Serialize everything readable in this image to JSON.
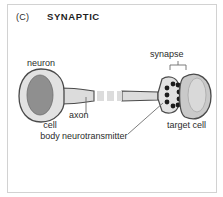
{
  "figure": {
    "panel_letter": "(C)",
    "title": "SYNAPTIC",
    "type": "biological-diagram"
  },
  "labels": {
    "neuron": "neuron",
    "cell_body": "cell\nbody",
    "cell_body_line1": "cell",
    "cell_body_line2": "body",
    "axon": "axon",
    "neurotransmitter": "neurotransmitter",
    "synapse": "synapse",
    "target_cell": "target cell"
  },
  "colors": {
    "background": "#ffffff",
    "frame_border": "#d2d2d2",
    "outline": "#4a4a4a",
    "cell_fill": "#e2e2e2",
    "nucleus_fill": "#8f8f8f",
    "target_fill": "#c9c9c9",
    "target_nucleus_fill": "#d9d9d9",
    "axon_fill": "#dcdcdc",
    "vesicle_fill": "#1c1c1c",
    "text": "#2b2b2b",
    "leader_line": "#6e6e6e"
  },
  "structures": [
    {
      "name": "neuron-cell-body",
      "shape": "rounded-teardrop",
      "has_nucleus": true
    },
    {
      "name": "axon",
      "shape": "tapering-tube",
      "interrupted": true,
      "break_style": "dashed"
    },
    {
      "name": "axon-terminal",
      "shape": "flared-bouton",
      "vesicle_count": 9
    },
    {
      "name": "synaptic-cleft",
      "shape": "narrow-gap"
    },
    {
      "name": "target-cell",
      "shape": "oval",
      "has_nucleus": true
    }
  ],
  "vesicles": {
    "count": 9,
    "inner_cluster": [
      {
        "cx": 159,
        "cy": 83
      },
      {
        "cx": 159,
        "cy": 90
      },
      {
        "cx": 159,
        "cy": 97
      },
      {
        "cx": 165,
        "cy": 79
      },
      {
        "cx": 165,
        "cy": 101
      }
    ],
    "membrane_bound": [
      {
        "cx": 170,
        "cy": 80
      },
      {
        "cx": 171,
        "cy": 87
      },
      {
        "cx": 171,
        "cy": 94
      },
      {
        "cx": 170,
        "cy": 100
      }
    ]
  }
}
